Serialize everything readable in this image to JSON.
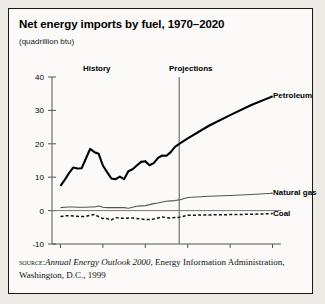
{
  "figure": {
    "title": "Net energy imports by fuel, 1970–2020",
    "subtitle": "(quadrillion btu)",
    "source": {
      "kicker": "source:",
      "italic_part": "Annual Energy Outlook 2000",
      "rest": ", Energy Information Administration, Washington, D.C., 1999"
    }
  },
  "annotations": {
    "history": "History",
    "projections": "Projections",
    "divider_year": 1998
  },
  "chart_data": {
    "type": "line",
    "title": "Net energy imports by fuel, 1970–2020",
    "xlabel": "",
    "ylabel": "quadrillion btu",
    "xlim": [
      1968,
      2022
    ],
    "ylim": [
      -10,
      40
    ],
    "yticks": [
      -10,
      0,
      10,
      20,
      30,
      40
    ],
    "xticks": [
      1970,
      1980,
      1990,
      2000,
      2010,
      2020
    ],
    "grid": false,
    "legend": "inline-right-labels",
    "x": [
      1970,
      1971,
      1972,
      1973,
      1974,
      1975,
      1976,
      1977,
      1978,
      1979,
      1980,
      1981,
      1982,
      1983,
      1984,
      1985,
      1986,
      1987,
      1988,
      1989,
      1990,
      1991,
      1992,
      1993,
      1994,
      1995,
      1996,
      1997,
      1998,
      2000,
      2005,
      2010,
      2015,
      2020
    ],
    "series": [
      {
        "name": "Petroleum",
        "style": "solid-thick",
        "values": [
          7.4,
          9.2,
          11.2,
          12.9,
          12.6,
          12.7,
          15.6,
          18.5,
          17.5,
          17.0,
          13.5,
          11.5,
          9.6,
          9.4,
          10.2,
          9.4,
          11.8,
          12.4,
          13.5,
          14.6,
          14.8,
          13.6,
          14.2,
          15.8,
          16.5,
          16.4,
          17.5,
          19.1,
          20.0,
          21.6,
          25.4,
          28.6,
          31.6,
          34.2
        ]
      },
      {
        "name": "Natural gas",
        "style": "solid-thin",
        "values": [
          0.9,
          1.0,
          1.1,
          1.1,
          1.0,
          1.0,
          1.0,
          1.1,
          1.1,
          1.4,
          1.0,
          0.9,
          0.9,
          0.9,
          0.9,
          0.9,
          0.7,
          1.0,
          1.3,
          1.4,
          1.5,
          1.8,
          2.1,
          2.3,
          2.6,
          2.8,
          2.9,
          3.0,
          3.2,
          3.9,
          4.3,
          4.5,
          4.8,
          5.2
        ]
      },
      {
        "name": "Coal",
        "style": "dashed",
        "values": [
          -1.8,
          -1.6,
          -1.5,
          -1.6,
          -1.7,
          -1.8,
          -1.7,
          -1.4,
          -1.2,
          -1.8,
          -2.4,
          -2.4,
          -2.8,
          -2.1,
          -2.3,
          -2.3,
          -2.2,
          -2.2,
          -2.4,
          -2.5,
          -2.7,
          -2.7,
          -2.5,
          -2.2,
          -1.9,
          -2.1,
          -2.2,
          -2.1,
          -2.0,
          -1.4,
          -1.3,
          -1.2,
          -1.1,
          -0.9
        ]
      }
    ]
  }
}
